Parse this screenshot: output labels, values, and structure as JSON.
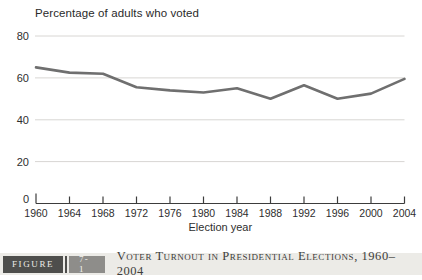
{
  "chart_data": {
    "type": "line",
    "title": "Percentage of adults who voted",
    "xlabel": "Election year",
    "x": [
      1960,
      1964,
      1968,
      1972,
      1976,
      1980,
      1984,
      1988,
      1992,
      1996,
      2000,
      2004
    ],
    "values": [
      65,
      62.5,
      62,
      55.5,
      54,
      53,
      55,
      50,
      56.5,
      50,
      52.5,
      59.5
    ],
    "yticks": [
      0,
      20,
      40,
      60,
      80
    ],
    "ylim": [
      0,
      80
    ],
    "grid": "horizontal-only",
    "legend": "none",
    "line_color": "#6f6f6f",
    "gridline_color": "#d8d6d3",
    "axis_color": "#3c3c3c",
    "text_color": "#2e2e2e"
  },
  "caption": {
    "figure_word": "FIGURE",
    "figure_number": "7-1",
    "text": "Voter Turnout in Presidential Elections, 1960–2004"
  }
}
